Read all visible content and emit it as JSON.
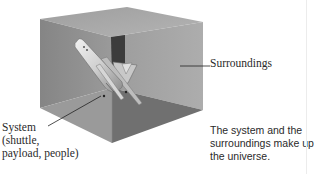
{
  "figure": {
    "type": "labeled-illustration"
  },
  "labels": {
    "system": {
      "lines": [
        "System",
        "(shuttle,",
        "payload, people)"
      ]
    },
    "surroundings": {
      "text": "Surroundings"
    }
  },
  "caption": {
    "lines": [
      "The system and the",
      "surroundings make up",
      "the universe."
    ]
  },
  "colors": {
    "box_top": "#a9a9a9",
    "box_left_wall": "#8f8f8f",
    "box_right_wall": "#a2a2a2",
    "box_back_corner": "#3a3a3a",
    "box_floor_left": "#9a9a9a",
    "box_floor_right": "#6e6e6e",
    "shuttle": "#d9d9d9",
    "leader_line": "#222222",
    "text": "#2a2a2a"
  }
}
